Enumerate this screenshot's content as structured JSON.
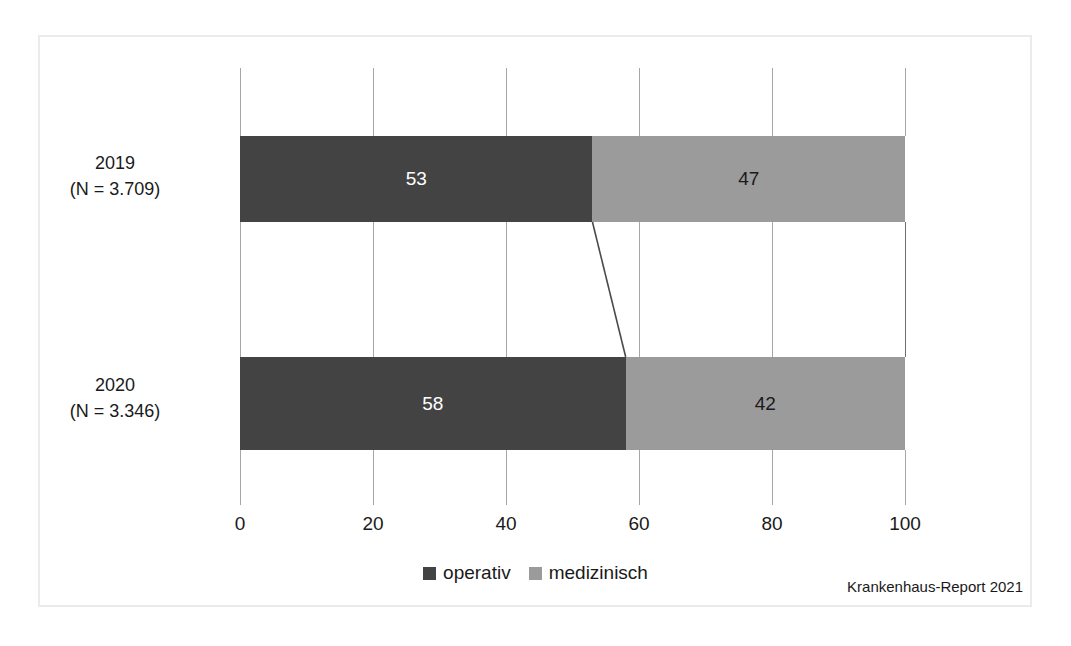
{
  "figure": {
    "source_caption": "Krankenhaus-Report 2021",
    "frame_color": "#ebebeb"
  },
  "legend": {
    "position": "bottom-center",
    "items": [
      {
        "label": "operativ",
        "color": "#434343",
        "swatch": "square-swatch-icon"
      },
      {
        "label": "medizinisch",
        "color": "#9b9b9b",
        "swatch": "square-swatch-icon"
      }
    ]
  },
  "chart_data": {
    "type": "bar",
    "orientation": "horizontal",
    "stacked": true,
    "normalized_percent": true,
    "title": "",
    "subtitle": "",
    "xlabel": "",
    "ylabel": "",
    "xlim": [
      0,
      100
    ],
    "xticks": [
      0,
      20,
      40,
      60,
      80,
      100
    ],
    "xtick_labels": [
      "0",
      "20",
      "40",
      "60",
      "80",
      "100"
    ],
    "grid": false,
    "categories": [
      "2019",
      "2020"
    ],
    "category_labels": [
      {
        "year": "2019",
        "n": "(N = 3.709)"
      },
      {
        "year": "2020",
        "n": "(N = 3.346)"
      }
    ],
    "series": [
      {
        "name": "operativ",
        "color": "#434343",
        "values": [
          53,
          47
        ]
      },
      {
        "name": "medizinisch",
        "color": "#9b9b9b",
        "values": [
          47,
          42
        ]
      }
    ],
    "bars": [
      {
        "category": "2019",
        "n_label": "(N = 3.709)",
        "segments": [
          {
            "name": "operativ",
            "value": 53,
            "label": "53",
            "color": "#434343"
          },
          {
            "name": "medizinisch",
            "value": 47,
            "label": "47",
            "color": "#9b9b9b"
          }
        ]
      },
      {
        "category": "2020",
        "n_label": "(N = 3.346)",
        "segments": [
          {
            "name": "operativ",
            "value": 58,
            "label": "58",
            "color": "#434343"
          },
          {
            "name": "medizinisch",
            "value": 42,
            "label": "42",
            "color": "#9b9b9b"
          }
        ]
      }
    ]
  }
}
